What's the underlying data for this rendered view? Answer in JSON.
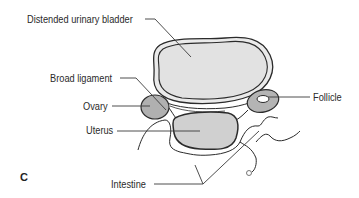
{
  "figure": {
    "panel_letter": "C",
    "labels": {
      "bladder": "Distended urinary bladder",
      "broad_ligament": "Broad ligament",
      "ovary": "Ovary",
      "uterus": "Uterus",
      "follicle": "Follicle",
      "intestine": "Intestine"
    }
  },
  "colors": {
    "outline": "#2b2b2b",
    "bladder_fill": "#e3e3e3",
    "uterus_fill": "#cfcfcf",
    "ovary_fill": "#a9a9a9",
    "leader_line": "#3a3a3a",
    "text": "#2a2a2a"
  }
}
